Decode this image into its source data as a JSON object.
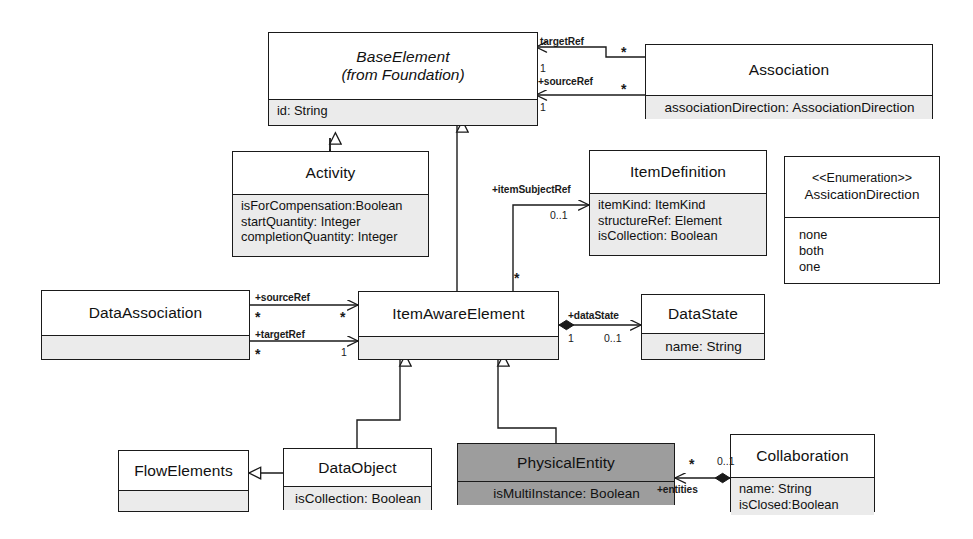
{
  "diagram": {
    "canvas": {
      "width": 973,
      "height": 539
    },
    "colors": {
      "line": "#1a1a1a",
      "box_fill": "#ffffff",
      "attr_fill": "#ebebeb",
      "highlight_fill": "#9d9d9d",
      "text": "#111111"
    }
  },
  "classes": {
    "base_element": {
      "name": "BaseElement",
      "subtitle": "(from Foundation)",
      "attributes": [
        "id: String"
      ]
    },
    "association": {
      "name": "Association",
      "attributes": [
        "associationDirection: AssociationDirection"
      ]
    },
    "activity": {
      "name": "Activity",
      "attributes": [
        "isForCompensation:Boolean",
        "startQuantity: Integer",
        "completionQuantity: Integer"
      ]
    },
    "item_definition": {
      "name": "ItemDefinition",
      "attributes": [
        "itemKind: ItemKind",
        "structureRef: Element",
        "isCollection: Boolean"
      ]
    },
    "assication_direction": {
      "stereotype": "<<Enumeration>>",
      "name": "AssicationDirection",
      "literals": [
        "none",
        "both",
        "one"
      ]
    },
    "data_association": {
      "name": "DataAssociation",
      "attributes": []
    },
    "item_aware_element": {
      "name": "ItemAwareElement",
      "attributes": []
    },
    "data_state": {
      "name": "DataState",
      "attributes": [
        "name: String"
      ]
    },
    "flow_elements": {
      "name": "FlowElements",
      "attributes": []
    },
    "data_object": {
      "name": "DataObject",
      "attributes": [
        "isCollection: Boolean"
      ]
    },
    "physical_entity": {
      "name": "PhysicalEntity",
      "attributes": [
        "isMultiInstance: Boolean"
      ],
      "highlighted": true
    },
    "collaboration": {
      "name": "Collaboration",
      "attributes": [
        "name: String",
        "isClosed:Boolean"
      ]
    }
  },
  "edges": {
    "assoc_target_ref": {
      "role": "targetRef",
      "source_mult": "*",
      "target_mult": "1"
    },
    "assoc_source_ref": {
      "role": "+sourceRef",
      "source_mult": "*",
      "target_mult": "1"
    },
    "item_subject_ref": {
      "role": "+itemSubjectRef",
      "source_mult": "*",
      "target_mult": "0..1"
    },
    "da_source_ref": {
      "role": "+sourceRef",
      "source_mult": "*",
      "target_mult": "*"
    },
    "da_target_ref": {
      "role": "+targetRef",
      "source_mult": "*",
      "target_mult": "1"
    },
    "data_state_ref": {
      "role": "+dataState",
      "source_mult": "1",
      "target_mult": "0..1"
    },
    "entities_ref": {
      "role": "+entities",
      "source_mult": "*",
      "target_mult": "0..1"
    }
  }
}
